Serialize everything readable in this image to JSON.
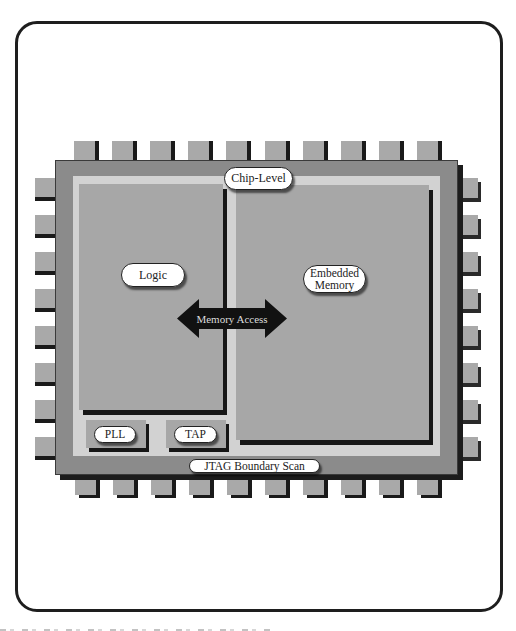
{
  "diagram": {
    "title": "Chip-Level",
    "blocks": {
      "logic": "Logic",
      "embedded_memory_line1": "Embedded",
      "embedded_memory_line2": "Memory",
      "pll": "PLL",
      "tap": "TAP"
    },
    "connections": {
      "memory_access": "Memory Access"
    },
    "boundary": "JTAG Boundary Scan",
    "pins": {
      "top": 10,
      "bottom": 10,
      "left": 8,
      "right": 8
    },
    "colors": {
      "chip_body": "#8b8b8b",
      "inner_band": "#d2d2d2",
      "block_fill": "#a7a7a7",
      "pin_fill": "#a9a9a9",
      "shadow": "#1c1c1c",
      "arrow": "#111111",
      "frame": "#1e1e1e"
    }
  }
}
